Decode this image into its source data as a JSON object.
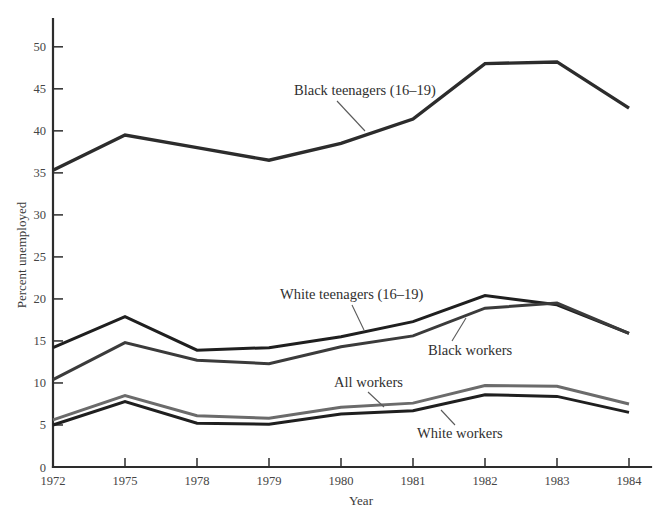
{
  "chart_data": {
    "type": "line",
    "title": "",
    "xlabel": "Year",
    "ylabel": "Percent unemployed",
    "categories": [
      "1972",
      "1975",
      "1978",
      "1979",
      "1980",
      "1981",
      "1982",
      "1983",
      "1984"
    ],
    "ylim": [
      0,
      52
    ],
    "y_ticks": [
      0,
      5,
      10,
      15,
      20,
      25,
      30,
      35,
      40,
      45,
      50
    ],
    "grid": false,
    "legend": "inline-annotations",
    "series": [
      {
        "name": "Black teenagers (16-19)",
        "label": "Black teenagers (16–19)",
        "color": "#2c2c2c",
        "width": 3.4,
        "values": [
          35.3,
          39.5,
          38.0,
          36.5,
          38.5,
          41.4,
          48.0,
          48.2,
          42.7
        ]
      },
      {
        "name": "White teenagers (16-19)",
        "label": "White teenagers (16–19)",
        "color": "#1f1f1f",
        "width": 3.0,
        "values": [
          14.2,
          17.9,
          13.9,
          14.2,
          15.5,
          17.3,
          20.4,
          19.3,
          15.9
        ]
      },
      {
        "name": "Black workers",
        "label": "Black workers",
        "color": "#3b3b3b",
        "width": 3.0,
        "values": [
          10.4,
          14.8,
          12.7,
          12.3,
          14.3,
          15.6,
          18.9,
          19.5,
          15.9
        ]
      },
      {
        "name": "All workers",
        "label": "All workers",
        "color": "#6b6b6b",
        "width": 3.0,
        "values": [
          5.6,
          8.5,
          6.1,
          5.8,
          7.1,
          7.6,
          9.7,
          9.6,
          7.5
        ]
      },
      {
        "name": "White workers",
        "label": "White workers",
        "color": "#1f1f1f",
        "width": 3.0,
        "values": [
          5.0,
          7.8,
          5.2,
          5.1,
          6.3,
          6.7,
          8.6,
          8.4,
          6.5
        ]
      }
    ],
    "annotations": [
      {
        "name": "black-teenagers",
        "text": "Black teenagers (16–19)",
        "text_x": 294,
        "text_y": 95,
        "leader": "337,101 365,131"
      },
      {
        "name": "white-teenagers",
        "text": "White teenagers (16–19)",
        "text_x": 280,
        "text_y": 299,
        "leader": "352,305 364,330"
      },
      {
        "name": "black-workers",
        "text": "Black workers",
        "text_x": 428,
        "text_y": 355,
        "leader": "452,341 466,318"
      },
      {
        "name": "all-workers",
        "text": "All workers",
        "text_x": 334,
        "text_y": 387,
        "leader": "368,392 384,407"
      },
      {
        "name": "white-workers",
        "text": "White workers",
        "text_x": 417,
        "text_y": 438,
        "leader": "455,425 441,410"
      }
    ]
  },
  "axis": {
    "y_title": "Percent unemployed",
    "x_title": "Year",
    "y_tick_labels": [
      "0",
      "5",
      "10",
      "15",
      "20",
      "25",
      "30",
      "35",
      "40",
      "45",
      "50"
    ],
    "x_tick_labels": [
      "1972",
      "1975",
      "1978",
      "1979",
      "1980",
      "1981",
      "1982",
      "1983",
      "1984"
    ]
  }
}
